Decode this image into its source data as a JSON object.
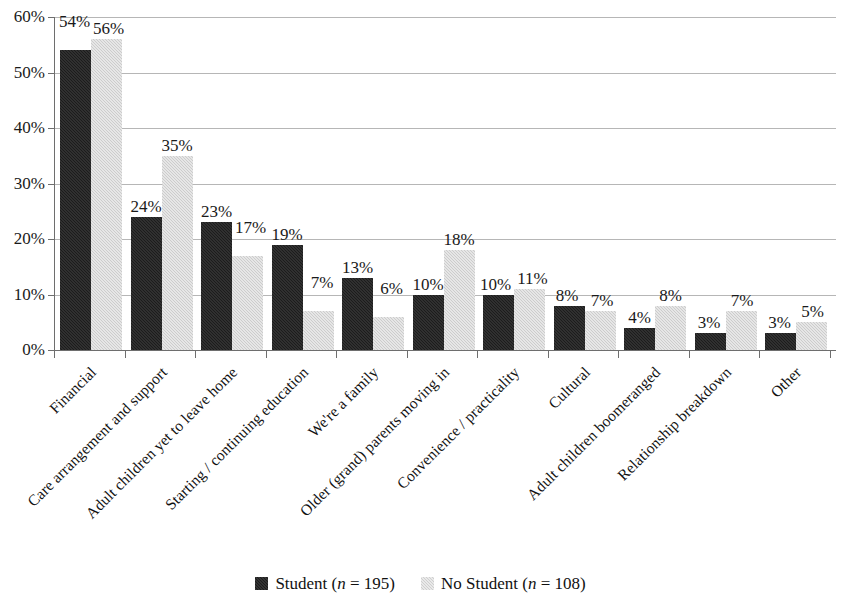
{
  "chart_data": {
    "type": "bar",
    "title": "",
    "subtitle": "",
    "xlabel": "",
    "ylabel": "",
    "ylim": [
      0,
      60
    ],
    "ytick_labels": [
      "0%",
      "10%",
      "20%",
      "30%",
      "40%",
      "50%",
      "60%"
    ],
    "ytick_values": [
      0,
      10,
      20,
      30,
      40,
      50,
      60
    ],
    "grid": true,
    "legend_position": "bottom",
    "value_label_suffix": "%",
    "categories": [
      "Financial",
      "Care arrangement and support",
      "Adult children yet to leave home",
      "Starting / continuing education",
      "We're a family",
      "Older (grand) parents moving in",
      "Convenience / practicality",
      "Cultural",
      "Adult children boomeranged",
      "Relationship breakdown",
      "Other"
    ],
    "series": [
      {
        "name": "Student (n = 195)",
        "color": "#1c1c1c",
        "values": [
          54,
          24,
          23,
          19,
          13,
          10,
          10,
          8,
          4,
          3,
          3
        ],
        "value_labels": [
          "54%",
          "24%",
          "23%",
          "19%",
          "13%",
          "10%",
          "10%",
          "8%",
          "4%",
          "3%",
          "3%"
        ]
      },
      {
        "name": "No Student (n = 108)",
        "color": "#cccccc",
        "values": [
          56,
          35,
          17,
          7,
          6,
          18,
          11,
          7,
          8,
          7,
          5
        ],
        "value_labels": [
          "56%",
          "35%",
          "17%",
          "7%",
          "6%",
          "18%",
          "11%",
          "7%",
          "8%",
          "7%",
          "5%"
        ]
      }
    ]
  },
  "legend": {
    "items": [
      {
        "label_main": "Student (",
        "label_italic": "n",
        "label_tail": " = 195)",
        "swatch": "student"
      },
      {
        "label_main": "No Student (",
        "label_italic": "n",
        "label_tail": " = 108)",
        "swatch": "nostudent"
      }
    ]
  }
}
